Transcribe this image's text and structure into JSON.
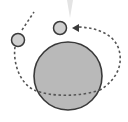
{
  "diagram": {
    "type": "orbit-illustration",
    "colors": {
      "background": "#ffffff",
      "planet_fill": "#b9b9b9",
      "outline": "#3a3a3a",
      "moon_fill": "#d0d0d0",
      "orbit": "#555555",
      "callout": "#e4e4e4"
    },
    "elements": {
      "planet": "large-planet",
      "moons": [
        "moon-left",
        "moon-top"
      ],
      "orbit": "dashed-orbit-path",
      "arrow": "direction-arrowhead",
      "callout": "callout-pointer"
    }
  }
}
